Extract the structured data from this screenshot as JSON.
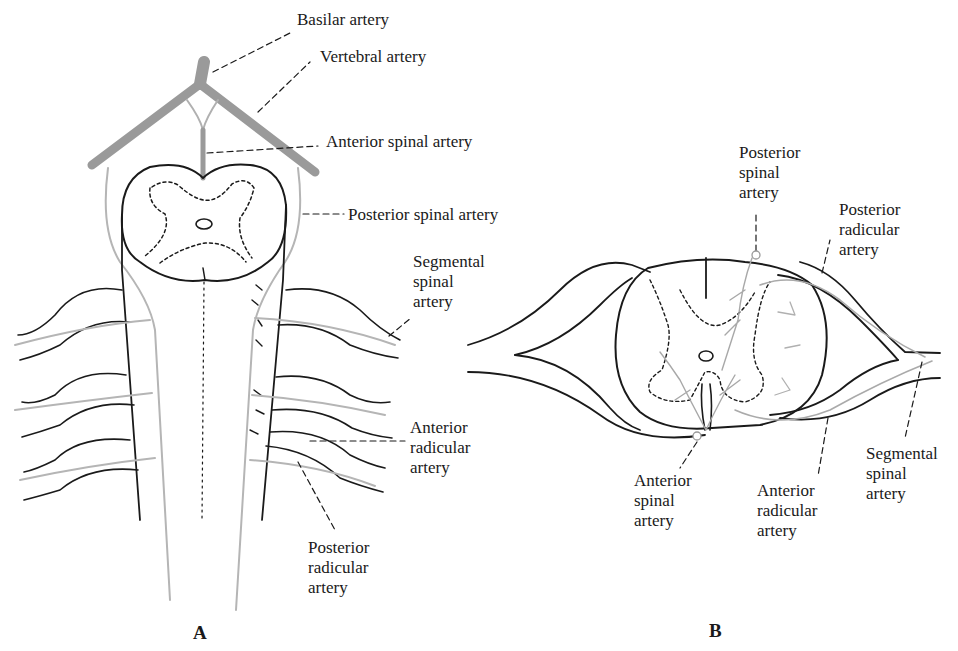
{
  "figure": {
    "panel_a": {
      "letter": "A",
      "labels": {
        "basilar": "Basilar artery",
        "vertebral": "Vertebral artery",
        "anterior_spinal": "Anterior spinal artery",
        "posterior_spinal": "Posterior spinal artery",
        "segmental_spinal": "Segmental\nspinal\nartery",
        "anterior_radicular": "Anterior\nradicular\nartery",
        "posterior_radicular": "Posterior\nradicular\nartery"
      }
    },
    "panel_b": {
      "letter": "B",
      "labels": {
        "posterior_spinal": "Posterior\nspinal\nartery",
        "posterior_radicular": "Posterior\nradicular\nartery",
        "anterior_spinal": "Anterior\nspinal\nartery",
        "anterior_radicular": "Anterior\nradicular\nartery",
        "segmental_spinal": "Segmental\nspinal\nartery"
      }
    },
    "colors": {
      "ink": "#1a1a1a",
      "artery": "#9a9a9a",
      "artery_light": "#b5b5b5",
      "background": "#ffffff"
    }
  }
}
